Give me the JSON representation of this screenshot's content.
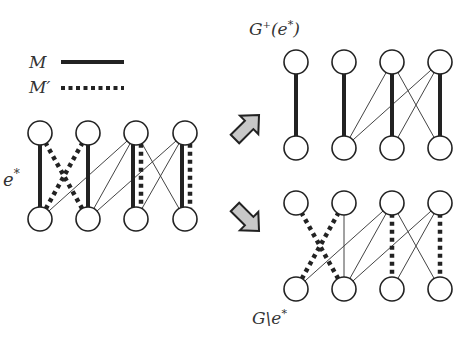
{
  "legend": {
    "matching_label": "M",
    "alt_matching_label": "M′",
    "matching_style": "solid",
    "alt_matching_style": "dotted"
  },
  "labels": {
    "edge_label": "e",
    "edge_label_sup": "*",
    "plus_graph_label": "G",
    "plus_graph_sup": "+",
    "plus_graph_arg": "(e",
    "plus_graph_arg_sup": "*",
    "plus_graph_close": ")",
    "minus_graph_label": "G\\e",
    "minus_graph_sup": "*"
  },
  "colors": {
    "stroke": "#222222",
    "thin_edge": "#444444",
    "arrow_fill": "#c8c8c8",
    "arrow_stroke": "#222222",
    "node_fill": "#ffffff"
  },
  "graphs": [
    {
      "id": "original",
      "edges": [
        {
          "top": 1,
          "bottom": 1,
          "type": "M"
        },
        {
          "top": 2,
          "bottom": 2,
          "type": "M"
        },
        {
          "top": 3,
          "bottom": 3,
          "type": "M"
        },
        {
          "top": 4,
          "bottom": 4,
          "type": "M"
        },
        {
          "top": 1,
          "bottom": 2,
          "type": "M'"
        },
        {
          "top": 2,
          "bottom": 1,
          "type": "M'"
        },
        {
          "top": 3,
          "bottom": 3,
          "type": "M'"
        },
        {
          "top": 4,
          "bottom": 4,
          "type": "M'"
        },
        {
          "top": 3,
          "bottom": 1,
          "type": "thin"
        },
        {
          "top": 3,
          "bottom": 2,
          "type": "thin"
        },
        {
          "top": 3,
          "bottom": 4,
          "type": "thin"
        },
        {
          "top": 4,
          "bottom": 2,
          "type": "thin"
        },
        {
          "top": 4,
          "bottom": 3,
          "type": "thin"
        }
      ]
    },
    {
      "id": "G-plus-e-star",
      "edges": [
        {
          "top": 1,
          "bottom": 1,
          "type": "M"
        },
        {
          "top": 2,
          "bottom": 2,
          "type": "M"
        },
        {
          "top": 3,
          "bottom": 3,
          "type": "M"
        },
        {
          "top": 4,
          "bottom": 4,
          "type": "M"
        },
        {
          "top": 3,
          "bottom": 2,
          "type": "thin"
        },
        {
          "top": 3,
          "bottom": 4,
          "type": "thin"
        },
        {
          "top": 4,
          "bottom": 2,
          "type": "thin"
        },
        {
          "top": 4,
          "bottom": 3,
          "type": "thin"
        }
      ]
    },
    {
      "id": "G-minus-e-star",
      "edges": [
        {
          "top": 1,
          "bottom": 2,
          "type": "M'"
        },
        {
          "top": 2,
          "bottom": 1,
          "type": "M'"
        },
        {
          "top": 3,
          "bottom": 3,
          "type": "M'"
        },
        {
          "top": 4,
          "bottom": 4,
          "type": "M'"
        },
        {
          "top": 2,
          "bottom": 2,
          "type": "thin"
        },
        {
          "top": 3,
          "bottom": 1,
          "type": "thin"
        },
        {
          "top": 3,
          "bottom": 2,
          "type": "thin"
        },
        {
          "top": 3,
          "bottom": 4,
          "type": "thin"
        },
        {
          "top": 4,
          "bottom": 2,
          "type": "thin"
        },
        {
          "top": 4,
          "bottom": 3,
          "type": "thin"
        }
      ]
    }
  ],
  "arrows": [
    {
      "id": "to-plus",
      "direction": "up-right"
    },
    {
      "id": "to-minus",
      "direction": "down-right"
    }
  ]
}
